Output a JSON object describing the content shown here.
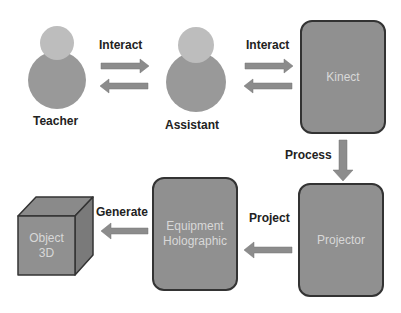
{
  "actors": [
    {
      "id": "teacher",
      "label": "Teacher"
    },
    {
      "id": "assistant",
      "label": "Assistant"
    }
  ],
  "nodes": {
    "kinect": {
      "label": "Kinect"
    },
    "projector": {
      "label": "Projector"
    },
    "equipment": {
      "line1": "Equipment",
      "line2": "Holographic"
    },
    "object": {
      "line1": "Object",
      "line2": "3D"
    }
  },
  "edges": {
    "teacher_assistant": "Interact",
    "assistant_kinect": "Interact",
    "kinect_projector": "Process",
    "projector_equipment": "Project",
    "equipment_object": "Generate"
  },
  "colors": {
    "head": "#bdbdbd",
    "body": "#999999",
    "box": "#909090",
    "arrow": "#8c8c8c",
    "border": "#333333"
  }
}
